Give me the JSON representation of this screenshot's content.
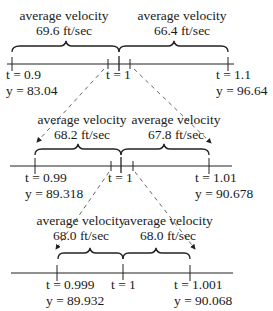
{
  "diagram": {
    "levels": [
      {
        "left_label": {
          "line1": "average velocity",
          "line2": "69.6 ft/sec"
        },
        "right_label": {
          "line1": "average velocity",
          "line2": "66.4 ft/sec"
        },
        "left_point": {
          "t": "t = 0.9",
          "y": "y = 83.04"
        },
        "center_point": {
          "t": "t = 1"
        },
        "right_point": {
          "t": "t = 1.1",
          "y": "y = 96.64"
        }
      },
      {
        "left_label": {
          "line1": "average velocity",
          "line2": "68.2 ft/sec"
        },
        "right_label": {
          "line1": "average velocity",
          "line2": "67.8 ft/sec"
        },
        "left_point": {
          "t": "t = 0.99",
          "y": "y = 89.318"
        },
        "center_point": {
          "t": "t = 1"
        },
        "right_point": {
          "t": "t = 1.01",
          "y": "y = 90.678"
        }
      },
      {
        "left_label": {
          "line1": "average velocity",
          "line2": "68.0 ft/sec"
        },
        "right_label": {
          "line1": "average velocity",
          "line2": "68.0 ft/sec"
        },
        "left_point": {
          "t": "t = 0.999",
          "y": "y = 89.932"
        },
        "center_point": {
          "t": "t = 1"
        },
        "right_point": {
          "t": "t = 1.001",
          "y": "y = 90.068"
        }
      }
    ]
  }
}
